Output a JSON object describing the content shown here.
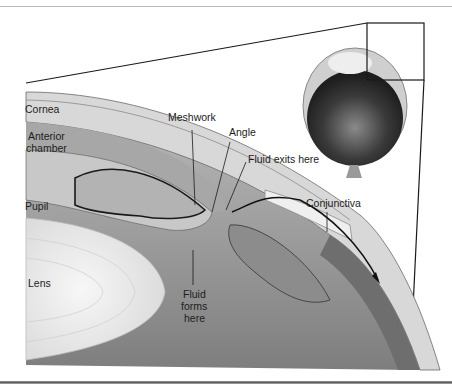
{
  "diagram": {
    "labels": {
      "cornea": "Cornea",
      "anterior_chamber_line1": "Anterior",
      "anterior_chamber_line2": "chamber",
      "pupil": "Pupil",
      "lens": "Lens",
      "meshwork": "Meshwork",
      "angle": "Angle",
      "fluid_exits": "Fluid exits here",
      "conjunctiva": "Conjunctiva",
      "fluid_forms_line1": "Fluid",
      "fluid_forms_line2": "forms",
      "fluid_forms_line3": "here"
    },
    "colors": {
      "outline": "#1a1a1a",
      "cornea": "#d9d9d9",
      "iris": "#9c9c9c",
      "lens": "#f2f2f2",
      "vitreous": "#8a8a8a",
      "eyeball_dark": "#2a2a2a"
    }
  }
}
